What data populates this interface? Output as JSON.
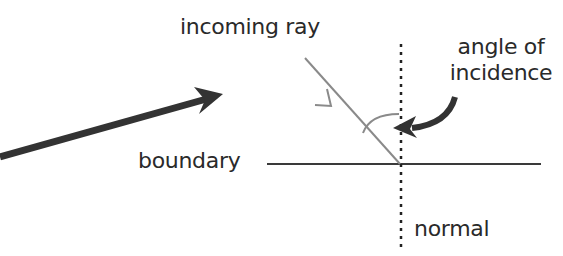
{
  "labels": {
    "incoming_ray": "incoming ray",
    "angle_line1": "angle of",
    "angle_line2": "incidence",
    "boundary": "boundary",
    "normal": "normal"
  },
  "colors": {
    "text": "#2a2a2a",
    "ray": "#8a8a8a",
    "boundary": "#3a3a3a",
    "arrow": "#333333"
  }
}
